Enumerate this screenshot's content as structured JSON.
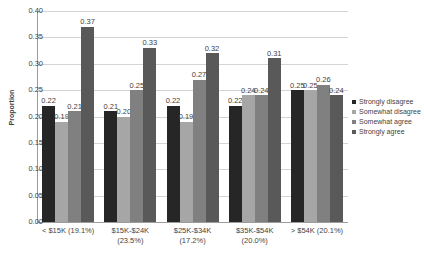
{
  "chart_data": {
    "type": "bar",
    "title": "",
    "xlabel": "",
    "ylabel": "Proportion",
    "ylim": [
      0.0,
      0.4
    ],
    "yticks": [
      "0.00",
      "0.05",
      "0.10",
      "0.15",
      "0.20",
      "0.25",
      "0.30",
      "0.35",
      "0.40"
    ],
    "ytick_values": [
      0.0,
      0.05,
      0.1,
      0.15,
      0.2,
      0.25,
      0.3,
      0.35,
      0.4
    ],
    "grid": true,
    "legend_position": "right",
    "categories": [
      "< $15K (19.1%)",
      "$15K-$24K (23.5%)",
      "$25K-$34K (17.2%)",
      "$35K-$54K (20.0%)",
      "> $54K (20.1%)"
    ],
    "series": [
      {
        "name": "Strongly disagree",
        "color": "#262626",
        "values": [
          0.22,
          0.21,
          0.22,
          0.22,
          0.25
        ],
        "labels": [
          "0.22",
          "0.21",
          "0.22",
          "0.22",
          "0.25"
        ]
      },
      {
        "name": "Somewhat disagree",
        "color": "#a6a6a6",
        "values": [
          0.19,
          0.2,
          0.19,
          0.24,
          0.25
        ],
        "labels": [
          "0.19",
          "0.20",
          "0.19",
          "0.24",
          "0.25"
        ]
      },
      {
        "name": "Somewhat agree",
        "color": "#808080",
        "values": [
          0.21,
          0.25,
          0.27,
          0.24,
          0.26
        ],
        "labels": [
          "0.21",
          "0.25",
          "0.27",
          "0.24",
          "0.26"
        ]
      },
      {
        "name": "Strongly agree",
        "color": "#595959",
        "values": [
          0.37,
          0.33,
          0.32,
          0.31,
          0.24
        ],
        "labels": [
          "0.37",
          "0.33",
          "0.32",
          "0.31",
          "0.24"
        ]
      }
    ]
  },
  "legend": {
    "items": [
      {
        "label": "Strongly disagree",
        "color": "#262626"
      },
      {
        "label": "Somewhat disagree",
        "color": "#a6a6a6"
      },
      {
        "label": "Somewhat agree",
        "color": "#808080"
      },
      {
        "label": "Strongly agree",
        "color": "#595959"
      }
    ]
  },
  "axes": {
    "y_title": "Proportion"
  }
}
